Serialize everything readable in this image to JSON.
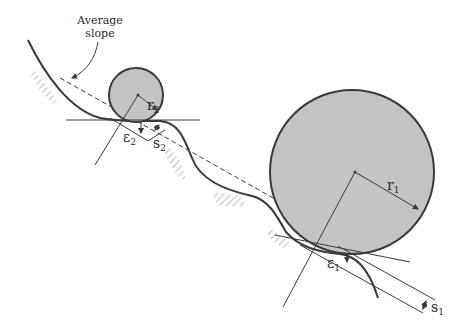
{
  "diagram": {
    "type": "tire-on-rough-road-slope",
    "annotation": {
      "line1": "Average",
      "line2": "slope"
    },
    "labels": {
      "r2": {
        "sym": "r",
        "sub": "2"
      },
      "e2": {
        "sym": "ε",
        "sub": "2"
      },
      "s2": {
        "sym": "s",
        "sub": "2"
      },
      "r1": {
        "sym": "r",
        "sub": "1"
      },
      "e1": {
        "sym": "ε",
        "sub": "1"
      },
      "s1": {
        "sym": "s",
        "sub": "1"
      }
    },
    "colors": {
      "wheel_fill": "#c4c4c4",
      "stroke": "#3a3a3a",
      "hatch": "#8a8a8a"
    },
    "wheels": [
      {
        "name": "small",
        "cx": 136,
        "cy": 95,
        "r": 27
      },
      {
        "name": "large",
        "cx": 352,
        "cy": 172,
        "r": 82
      }
    ]
  }
}
